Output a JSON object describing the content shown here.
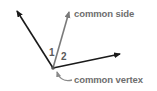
{
  "diagram": {
    "type": "adjacent-angles",
    "labels": {
      "common_side": "common side",
      "common_vertex": "common vertex"
    },
    "angles": [
      {
        "id": "angle-1",
        "label": "1"
      },
      {
        "id": "angle-2",
        "label": "2"
      }
    ],
    "vertex": [
      53,
      68
    ],
    "rays": [
      {
        "name": "left-ray",
        "to": [
          16,
          10
        ],
        "color": "#1a1a1a"
      },
      {
        "name": "common-side-ray",
        "to": [
          70,
          10
        ],
        "color": "#7a7a7a"
      },
      {
        "name": "right-ray",
        "to": [
          121,
          54
        ],
        "color": "#1a1a1a"
      }
    ],
    "colors": {
      "ray_dark": "#1a1a1a",
      "ray_gray": "#7a7a7a",
      "label_text": "#6e6e6e",
      "background": "#ffffff"
    }
  }
}
